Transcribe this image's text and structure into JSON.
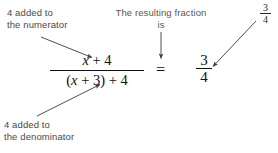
{
  "figure": {
    "type": "algebraic-annotation-diagram",
    "background_color": "#ffffff",
    "text_color": "#111111",
    "caption_color": "#4a4a4a",
    "arrow_color": "#3a3a3a"
  },
  "captions": {
    "numerator_note": "4 added to\nthe numerator",
    "denominator_note": "4 added to\nthe denominator",
    "resulting_note": "The resulting fraction\nis"
  },
  "main_fraction": {
    "numerator_var": "x",
    "numerator_rest": " + 4",
    "denominator_open": "(",
    "denominator_var": "x",
    "denominator_rest": " + 3) + 4"
  },
  "relation": {
    "equals": "="
  },
  "result_fraction": {
    "numerator": "3",
    "denominator": "4"
  },
  "small_fraction": {
    "numerator": "3",
    "denominator": "4"
  },
  "arrows": [
    {
      "name": "arrow-to-numerator",
      "from": [
        41,
        37
      ],
      "to": [
        93,
        58
      ],
      "description": "points from the numerator note down-right to the numerator"
    },
    {
      "name": "arrow-to-denominator",
      "from": [
        37,
        116
      ],
      "to": [
        101,
        84
      ],
      "description": "points from the denominator note up-right to the denominator"
    },
    {
      "name": "arrow-down-to-equals",
      "from": [
        161,
        32
      ],
      "to": [
        161,
        59
      ],
      "description": "vertical arrow from the resulting-fraction note down to the equals sign"
    },
    {
      "name": "arrow-to-result-fraction",
      "from": [
        256,
        21
      ],
      "to": [
        212,
        67
      ],
      "description": "diagonal arrow from the small 3/4 label down-left to the result fraction"
    }
  ]
}
